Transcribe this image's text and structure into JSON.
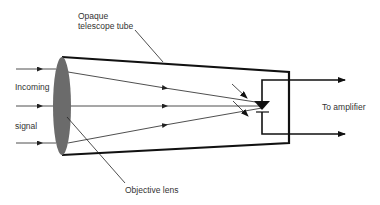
{
  "labels": {
    "tube_line1": "Opaque",
    "tube_line2": "telescope tube",
    "incoming": "Incoming",
    "signal": "signal",
    "lens": "Objective lens",
    "amplifier": "To amplifier"
  },
  "colors": {
    "lens_fill": "#6b6b6b",
    "line": "#111111",
    "text": "#333333"
  }
}
